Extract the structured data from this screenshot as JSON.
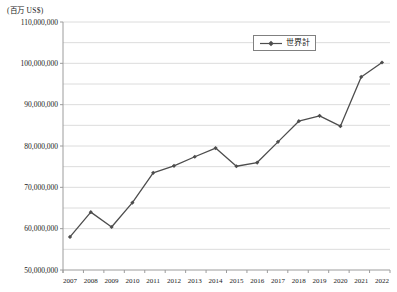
{
  "chart_data": {
    "type": "line",
    "title": "",
    "unit_label": "(百万 US$)",
    "xlabel": "",
    "ylabel": "(百万 US$)",
    "categories": [
      "2007",
      "2008",
      "2009",
      "2010",
      "2011",
      "2012",
      "2013",
      "2014",
      "2015",
      "2016",
      "2017",
      "2018",
      "2019",
      "2020",
      "2021",
      "2022"
    ],
    "series": [
      {
        "name": "世界計",
        "values": [
          58000000,
          64000000,
          60400000,
          66300000,
          73500000,
          75200000,
          77400000,
          79500000,
          75100000,
          76000000,
          81000000,
          86000000,
          87300000,
          84800000,
          96700000,
          100200000
        ]
      }
    ],
    "ylim": [
      50000000,
      110000000
    ],
    "ytick_step": 10000000,
    "gridline_step": 5000000,
    "grid": true,
    "legend_position": "top-center",
    "marker": "diamond",
    "colors": {
      "line": "#4d4d4d",
      "marker": "#4d4d4d",
      "gridline": "#dcdcdc",
      "axis": "#9c9c9c",
      "text": "#1a1a1a",
      "legend_border": "#808080",
      "background": "#ffffff"
    }
  }
}
